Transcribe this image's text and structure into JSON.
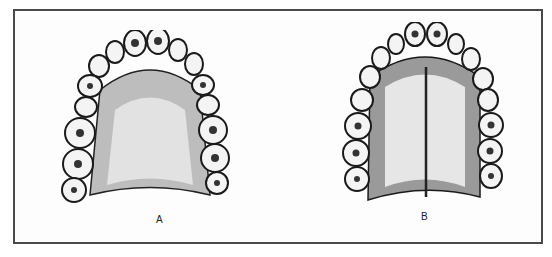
{
  "figure": {
    "panels": [
      {
        "id": "A",
        "label": "A",
        "description": "Maxillary dental arch, broad U-shaped palate"
      },
      {
        "id": "B",
        "label": "B",
        "description": "Maxillary dental arch, narrow high palate with midline ridge"
      }
    ],
    "colors": {
      "border": "#4a4a4a",
      "ink": "#1a1a1a",
      "palate": "#cfcfcf",
      "tooth": "#f4f4f4"
    }
  }
}
